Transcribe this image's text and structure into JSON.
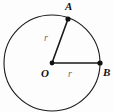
{
  "figure": {
    "background_color": "#fdfdfd",
    "stroke_color": "#1a1a1a",
    "label_color": "#111111",
    "measure_color": "#6e6e6e"
  },
  "circle": {
    "center_x": 52,
    "center_y": 63,
    "radius": 48,
    "stroke_width": 1.1
  },
  "points": [
    {
      "id": "A",
      "label": "A",
      "x": 68,
      "y": 19,
      "dot_radius": 2.6
    },
    {
      "id": "O",
      "label": "O",
      "x": 52,
      "y": 63,
      "dot_radius": 2.4
    },
    {
      "id": "B",
      "label": "B",
      "x": 100,
      "y": 63,
      "dot_radius": 2.6
    }
  ],
  "segments": [
    {
      "id": "OA",
      "from": "O",
      "to": "A",
      "x1": 52,
      "y1": 63,
      "x2": 68,
      "y2": 19,
      "label": "r",
      "stroke_width": 1.6
    },
    {
      "id": "OB",
      "from": "O",
      "to": "B",
      "x1": 52,
      "y1": 63,
      "x2": 100,
      "y2": 63,
      "label": "r",
      "stroke_width": 1.6
    }
  ],
  "labels": {
    "point_a": "A",
    "point_o": "O",
    "point_b": "B",
    "radius_oa": "r",
    "radius_ob": "r"
  }
}
